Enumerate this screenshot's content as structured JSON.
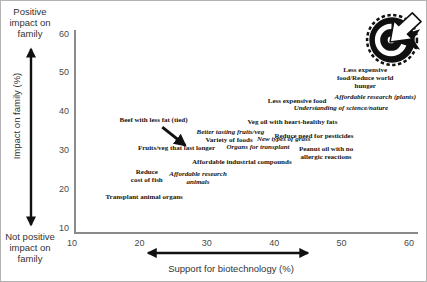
{
  "figure": {
    "left_top_label": "Positive\nimpact on\nfamily",
    "left_bottom_label": "Not positive\nimpact on\nfamily",
    "y_axis_title": "Impact on family (%)",
    "x_axis_title": "Support for biotechnology (%)",
    "stamp_icon": "dart-target-stamp",
    "text_color": "#333333",
    "axis_color": "#8a8a8a",
    "arrow_color": "#111111"
  },
  "chart_data": {
    "type": "scatter",
    "title": "",
    "xlabel": "Support for biotechnology (%)",
    "ylabel": "Impact on family (%)",
    "xlim": [
      10,
      60
    ],
    "ylim": [
      10,
      60
    ],
    "x_ticks": [
      "10",
      "20",
      "30",
      "40",
      "50",
      "60"
    ],
    "y_ticks": [
      "60",
      "50",
      "40",
      "30",
      "20",
      "10"
    ],
    "y_tick_values": [
      60,
      50,
      40,
      30,
      20,
      10
    ],
    "x_tick_values": [
      10,
      20,
      30,
      40,
      50,
      60
    ],
    "grid": false,
    "legend": "none",
    "points": [
      {
        "label": "Beef with less fat (tied)",
        "x": 22.1,
        "y": 37.6,
        "italic": false
      },
      {
        "label": "Fruits/veg that last longer",
        "x": 25.5,
        "y": 30.3,
        "italic": false
      },
      {
        "label": "Better tasting fruits/veg",
        "x": 33.5,
        "y": 34.4,
        "italic": true
      },
      {
        "label": "Variety of foods",
        "x": 33.3,
        "y": 32.4,
        "italic": false
      },
      {
        "label": "New types of grass",
        "x": 41.4,
        "y": 32.6,
        "italic": true
      },
      {
        "label": "Organs for transplant",
        "x": 37.6,
        "y": 30.6,
        "italic": true
      },
      {
        "label": "Affordable industrial compounds",
        "x": 35.2,
        "y": 26.7,
        "italic": false
      },
      {
        "label": "Reduce\ncost of fish",
        "x": 21.1,
        "y": 23.1,
        "italic": false
      },
      {
        "label": "Affordable research\nanimals",
        "x": 28.7,
        "y": 22.6,
        "italic": true
      },
      {
        "label": "Transplant animal organs",
        "x": 20.7,
        "y": 17.8,
        "italic": false
      },
      {
        "label": "Less expensive\nfood/Reduce world\nhunger",
        "x": 53.5,
        "y": 48.4,
        "italic": false
      },
      {
        "label": "Affordable research (plants)",
        "x": 55.0,
        "y": 43.6,
        "italic": true
      },
      {
        "label": "Less expensive food",
        "x": 43.4,
        "y": 42.5,
        "italic": false
      },
      {
        "label": "Understanding of science/nature",
        "x": 49.9,
        "y": 40.7,
        "italic": true
      },
      {
        "label": "Veg oil with heart-healthy fats",
        "x": 42.7,
        "y": 37.1,
        "italic": false
      },
      {
        "label": "Reduce need for pesticides",
        "x": 45.9,
        "y": 33.4,
        "italic": false
      },
      {
        "label": "Peanut oil with no\nallergic reactions",
        "x": 47.7,
        "y": 29.1,
        "italic": false
      }
    ],
    "annotations": {
      "tied_arrow": {
        "from": {
          "x": 23.4,
          "y": 36.0
        },
        "to": {
          "x": 26.8,
          "y": 31.3
        }
      },
      "x_range_arrow": {
        "x1": 21.3,
        "x2": 45.0
      }
    }
  }
}
